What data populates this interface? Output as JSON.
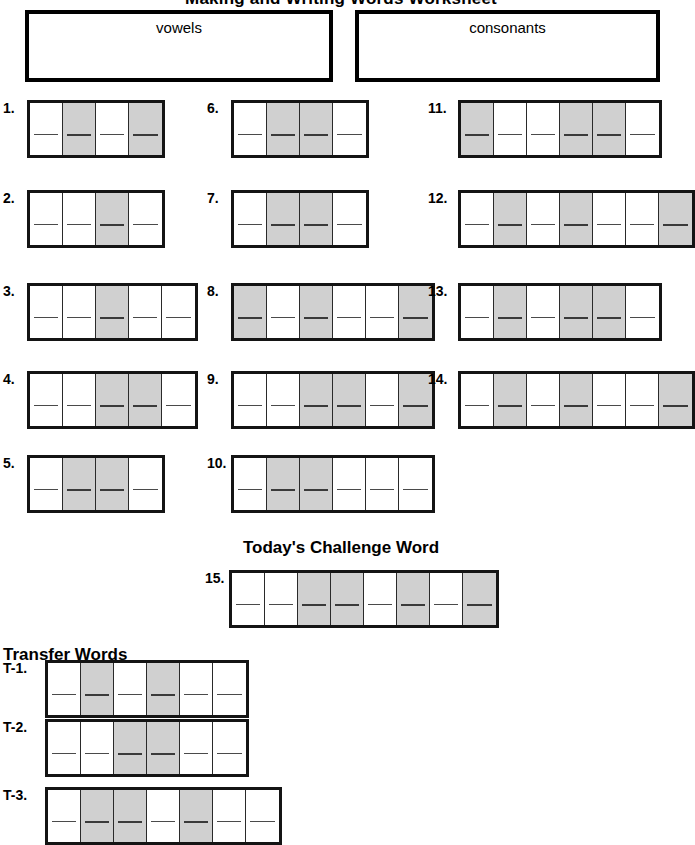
{
  "worksheet": {
    "title": "Making and Writing Words Worksheet",
    "sort_boxes": [
      {
        "name": "vowels",
        "label": "vowels"
      },
      {
        "name": "consonants",
        "label": "consonants"
      }
    ],
    "challenge_heading": "Today's Challenge Word",
    "transfer_heading": "Transfer Words",
    "legend": {
      "shaded_cell": "shaded letter box",
      "plain_cell": "plain letter box",
      "shaded_color": "#d0d0d0",
      "border_color": "#141414"
    },
    "columns": [
      {
        "name": "column-1",
        "items": [
          {
            "number": "1.",
            "cells": [
              "plain",
              "shaded",
              "plain",
              "shaded"
            ]
          },
          {
            "number": "2.",
            "cells": [
              "plain",
              "plain",
              "shaded",
              "plain"
            ]
          },
          {
            "number": "3.",
            "cells": [
              "plain",
              "plain",
              "shaded",
              "plain",
              "plain"
            ]
          },
          {
            "number": "4.",
            "cells": [
              "plain",
              "plain",
              "shaded",
              "shaded",
              "plain"
            ]
          },
          {
            "number": "5.",
            "cells": [
              "plain",
              "shaded",
              "shaded",
              "plain"
            ]
          }
        ]
      },
      {
        "name": "column-2",
        "items": [
          {
            "number": "6.",
            "cells": [
              "plain",
              "shaded",
              "shaded",
              "plain"
            ]
          },
          {
            "number": "7.",
            "cells": [
              "plain",
              "shaded",
              "shaded",
              "plain"
            ]
          },
          {
            "number": "8.",
            "cells": [
              "shaded",
              "plain",
              "shaded",
              "plain",
              "plain",
              "shaded"
            ]
          },
          {
            "number": "9.",
            "cells": [
              "plain",
              "plain",
              "shaded",
              "shaded",
              "plain",
              "shaded"
            ]
          },
          {
            "number": "10.",
            "cells": [
              "plain",
              "shaded",
              "shaded",
              "plain",
              "plain",
              "plain"
            ]
          }
        ]
      },
      {
        "name": "column-3",
        "items": [
          {
            "number": "11.",
            "cells": [
              "shaded",
              "plain",
              "plain",
              "shaded",
              "shaded",
              "plain"
            ]
          },
          {
            "number": "12.",
            "cells": [
              "plain",
              "shaded",
              "plain",
              "shaded",
              "plain",
              "plain",
              "shaded"
            ]
          },
          {
            "number": "13.",
            "cells": [
              "plain",
              "shaded",
              "plain",
              "shaded",
              "shaded",
              "plain"
            ]
          },
          {
            "number": "14.",
            "cells": [
              "plain",
              "shaded",
              "plain",
              "shaded",
              "plain",
              "plain",
              "shaded"
            ]
          }
        ]
      }
    ],
    "challenge_item": {
      "number": "15.",
      "cells": [
        "plain",
        "plain",
        "shaded",
        "shaded",
        "plain",
        "shaded",
        "plain",
        "shaded"
      ]
    },
    "transfer_items": [
      {
        "number": "T-1.",
        "cells": [
          "plain",
          "shaded",
          "plain",
          "shaded",
          "plain",
          "plain"
        ]
      },
      {
        "number": "T-2.",
        "cells": [
          "plain",
          "plain",
          "shaded",
          "shaded",
          "plain",
          "plain"
        ]
      },
      {
        "number": "T-3.",
        "cells": [
          "plain",
          "shaded",
          "shaded",
          "plain",
          "shaded",
          "plain",
          "plain"
        ]
      }
    ]
  }
}
